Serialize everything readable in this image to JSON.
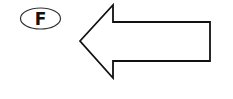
{
  "figure": {
    "label": "F",
    "arrow_direction": "left",
    "colors": {
      "stroke": "#111111",
      "fill": "#ffffff",
      "label_stroke": "#333333"
    }
  }
}
